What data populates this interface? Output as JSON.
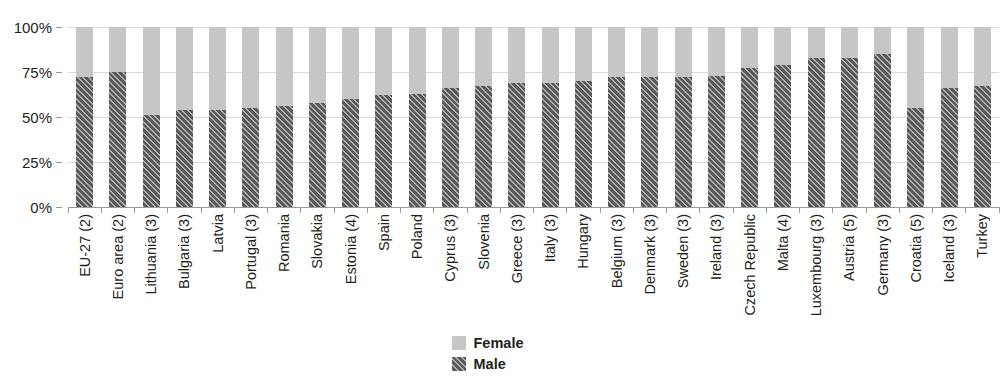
{
  "chart_data": {
    "type": "bar",
    "subtype": "stacked-100-percent",
    "title": "",
    "subtitle": "",
    "xlabel": "",
    "ylabel": "",
    "ylim": [
      0,
      100
    ],
    "y_tick_labels": [
      "100%",
      "75%",
      "50%",
      "25%",
      "0%"
    ],
    "y_tick_values": [
      100,
      75,
      50,
      25,
      0
    ],
    "grid": true,
    "grid_axis": "y",
    "legend_position": "bottom-center",
    "legend": [
      {
        "name": "Female",
        "color": "#c6c6c6",
        "pattern": "solid"
      },
      {
        "name": "Male",
        "color": "#595959",
        "pattern": "diagonal-hatch"
      }
    ],
    "categories": [
      "EU-27 (2)",
      "Euro area (2)",
      "Lithuania (3)",
      "Bulgaria (3)",
      "Latvia",
      "Portugal (3)",
      "Romania",
      "Slovakia",
      "Estonia (4)",
      "Spain",
      "Poland",
      "Cyprus (3)",
      "Slovenia",
      "Greece (3)",
      "Italy (3)",
      "Hungary",
      "Belgium (3)",
      "Denmark (3)",
      "Sweden (3)",
      "Ireland (3)",
      "Czech Republic",
      "Malta (4)",
      "Luxembourg (3)",
      "Austria (5)",
      "Germany (3)",
      "Croatia (5)",
      "Iceland (3)",
      "Turkey"
    ],
    "series": [
      {
        "name": "Male",
        "color": "#595959",
        "values": [
          72,
          75,
          51,
          54,
          54,
          55,
          56,
          58,
          60,
          62,
          63,
          66,
          67,
          69,
          69,
          70,
          72,
          72,
          72,
          73,
          77,
          79,
          83,
          83,
          85,
          55,
          66,
          67
        ]
      },
      {
        "name": "Female",
        "color": "#c6c6c6",
        "values": [
          28,
          25,
          49,
          46,
          46,
          45,
          44,
          42,
          40,
          38,
          37,
          34,
          33,
          31,
          31,
          30,
          28,
          28,
          28,
          27,
          23,
          21,
          17,
          17,
          15,
          45,
          34,
          33
        ]
      }
    ]
  }
}
